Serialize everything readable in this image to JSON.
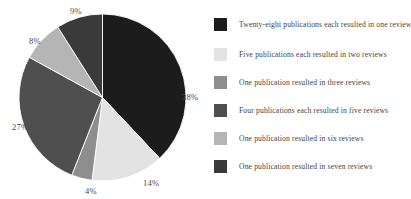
{
  "chart_data": {
    "type": "pie",
    "title": "",
    "subtitle": "",
    "xlabel": "",
    "ylabel": "",
    "grid": false,
    "legend_position": "right",
    "start_angle_deg": 0,
    "direction": "clockwise",
    "categories": [
      "Twenty-eight publications each resulted in one review",
      "Five publications each resulted in two reviews",
      "One publication resulted in three reviews",
      "Four publications each resulted in five reviews",
      "One publication resulted in six reviews",
      "One publication resulted in seven reviews"
    ],
    "values": [
      38,
      14,
      4,
      27,
      8,
      9
    ],
    "data_labels": [
      "38%",
      "14%",
      "4%",
      "27%",
      "8%",
      "9%"
    ],
    "colors": [
      "#1c1c1c",
      "#e3e3e3",
      "#8e8e8e",
      "#4f4f4f",
      "#b5b5b5",
      "#3a3a3a"
    ]
  },
  "pie": {
    "slices": [
      {
        "id": "slice-one-review",
        "label": "38%",
        "value": 38,
        "color": "#1c1c1c",
        "label_x": "182",
        "label_y": "92"
      },
      {
        "id": "slice-two-reviews",
        "label": "14%",
        "value": 14,
        "color": "#e3e3e3",
        "label_x": "143",
        "label_y": "178"
      },
      {
        "id": "slice-three-reviews",
        "label": "4%",
        "value": 4,
        "color": "#8e8e8e",
        "label_x": "85",
        "label_y": "186"
      },
      {
        "id": "slice-five-reviews",
        "label": "27%",
        "value": 27,
        "color": "#4f4f4f",
        "label_x": "12",
        "label_y": "122"
      },
      {
        "id": "slice-six-reviews",
        "label": "8%",
        "value": 8,
        "color": "#b5b5b5",
        "label_x": "29",
        "label_y": "36"
      },
      {
        "id": "slice-seven-reviews",
        "label": "9%",
        "value": 9,
        "color": "#3a3a3a",
        "label_x": "70",
        "label_y": "6"
      }
    ]
  },
  "legend": {
    "items": [
      {
        "label": "Twenty-eight publications each resulted in one review",
        "color": "#1c1c1c",
        "top": "2"
      },
      {
        "label": "Five publications each resulted in two reviews",
        "color": "#e3e3e3",
        "top": "32"
      },
      {
        "label": "One publication resulted in three reviews",
        "color": "#8e8e8e",
        "top": "60"
      },
      {
        "label": "Four publications each resulted in five reviews",
        "color": "#4f4f4f",
        "top": "88"
      },
      {
        "label": "One publication resulted in six reviews",
        "color": "#b5b5b5",
        "top": "116"
      },
      {
        "label": "One publication resulted in seven reviews",
        "color": "#3a3a3a",
        "top": "144"
      }
    ]
  }
}
